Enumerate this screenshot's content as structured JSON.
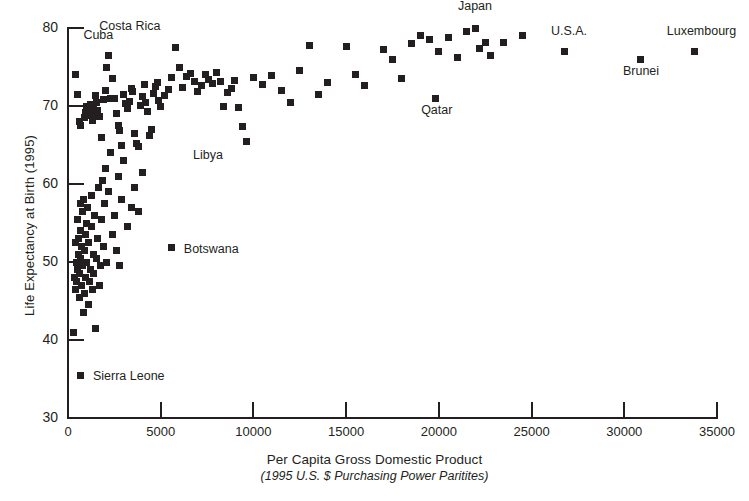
{
  "chart_data": {
    "type": "scatter",
    "title": "",
    "xlabel": "Per Capita Gross Domestic Product",
    "xlabel_sub": "(1995 U.S. $ Purchasing Power Paritites)",
    "ylabel": "Life Expectancy at Birth (1995)",
    "xlim": [
      0,
      35000
    ],
    "ylim": [
      30,
      80
    ],
    "xticks": [
      0,
      5000,
      10000,
      15000,
      20000,
      25000,
      30000,
      35000
    ],
    "xtick_labels": [
      "0",
      "5000",
      "10000",
      "15000",
      "20000",
      "25000",
      "30000",
      "35000"
    ],
    "yticks": [
      30,
      40,
      50,
      60,
      70,
      80
    ],
    "ytick_labels": [
      "30",
      "40",
      "50",
      "60",
      "70",
      "80"
    ],
    "grid": false,
    "legend": "none",
    "marker": "square",
    "marker_color": "#231f20",
    "points": [
      [
        400,
        74.0
      ],
      [
        500,
        71.5
      ],
      [
        600,
        68.0
      ],
      [
        700,
        67.5
      ],
      [
        900,
        68.5
      ],
      [
        950,
        69.2
      ],
      [
        1000,
        70.0
      ],
      [
        1050,
        69.5
      ],
      [
        1100,
        69.0
      ],
      [
        1150,
        68.8
      ],
      [
        1200,
        70.2
      ],
      [
        1250,
        69.6
      ],
      [
        1300,
        68.2
      ],
      [
        1350,
        69.8
      ],
      [
        1400,
        69.1
      ],
      [
        1500,
        71.3
      ],
      [
        1550,
        70.5
      ],
      [
        1600,
        69.4
      ],
      [
        1700,
        68.6
      ],
      [
        1800,
        66.0
      ],
      [
        1900,
        70.8
      ],
      [
        2000,
        72.0
      ],
      [
        2100,
        75.0
      ],
      [
        2200,
        76.5
      ],
      [
        2300,
        70.9
      ],
      [
        2400,
        73.5
      ],
      [
        2500,
        71.0
      ],
      [
        2600,
        69.0
      ],
      [
        2700,
        67.5
      ],
      [
        2800,
        66.8
      ],
      [
        2900,
        65.0
      ],
      [
        3000,
        71.5
      ],
      [
        3100,
        70.3
      ],
      [
        3200,
        69.7
      ],
      [
        3300,
        70.6
      ],
      [
        3400,
        72.3
      ],
      [
        3500,
        71.8
      ],
      [
        3600,
        66.5
      ],
      [
        3700,
        65.2
      ],
      [
        3800,
        64.8
      ],
      [
        3900,
        70.1
      ],
      [
        4000,
        71.2
      ],
      [
        4100,
        72.8
      ],
      [
        4200,
        70.4
      ],
      [
        4300,
        69.3
      ],
      [
        4400,
        66.2
      ],
      [
        4500,
        67.0
      ],
      [
        4600,
        71.6
      ],
      [
        4700,
        72.5
      ],
      [
        4800,
        73.0
      ],
      [
        4900,
        70.7
      ],
      [
        5000,
        69.9
      ],
      [
        5200,
        71.4
      ],
      [
        5400,
        72.1
      ],
      [
        5600,
        73.6
      ],
      [
        5800,
        77.5
      ],
      [
        6000,
        75.0
      ],
      [
        6200,
        72.4
      ],
      [
        6400,
        73.8
      ],
      [
        6600,
        74.2
      ],
      [
        6800,
        73.2
      ],
      [
        7000,
        71.9
      ],
      [
        7200,
        72.6
      ],
      [
        7400,
        74.0
      ],
      [
        7600,
        73.4
      ],
      [
        7800,
        72.9
      ],
      [
        8000,
        74.3
      ],
      [
        8200,
        73.1
      ],
      [
        8400,
        70.0
      ],
      [
        8600,
        71.7
      ],
      [
        8800,
        72.2
      ],
      [
        9000,
        73.3
      ],
      [
        9200,
        69.8
      ],
      [
        9400,
        67.4
      ],
      [
        9600,
        65.5
      ],
      [
        10000,
        73.7
      ],
      [
        10500,
        72.7
      ],
      [
        11000,
        73.9
      ],
      [
        11500,
        72.0
      ],
      [
        12000,
        70.5
      ],
      [
        12500,
        74.5
      ],
      [
        13000,
        77.8
      ],
      [
        13500,
        71.5
      ],
      [
        14000,
        73.0
      ],
      [
        15000,
        77.6
      ],
      [
        15500,
        74.0
      ],
      [
        16000,
        72.6
      ],
      [
        17000,
        77.3
      ],
      [
        17500,
        76.0
      ],
      [
        18000,
        73.5
      ],
      [
        18500,
        78.0
      ],
      [
        19000,
        79.0
      ],
      [
        19500,
        78.5
      ],
      [
        19800,
        71.0
      ],
      [
        20000,
        77.0
      ],
      [
        20500,
        78.8
      ],
      [
        21000,
        76.2
      ],
      [
        21500,
        79.5
      ],
      [
        22000,
        80.0
      ],
      [
        22200,
        77.4
      ],
      [
        22500,
        78.2
      ],
      [
        22800,
        76.5
      ],
      [
        23500,
        78.2
      ],
      [
        24500,
        79.0
      ],
      [
        26800,
        77.0
      ],
      [
        30900,
        76.0
      ],
      [
        33800,
        77.0
      ]
    ],
    "annotations": [
      {
        "label": "Cuba",
        "x": 1800,
        "y": 76.5
      },
      {
        "label": "Costa Rica",
        "x": 3200,
        "y": 77.5
      },
      {
        "label": "Japan",
        "x": 22000,
        "y": 80.0
      },
      {
        "label": "U.S.A.",
        "x": 26800,
        "y": 77.0
      },
      {
        "label": "Luxembourg",
        "x": 33800,
        "y": 77.0
      },
      {
        "label": "Brunei",
        "x": 30900,
        "y": 76.0
      },
      {
        "label": "Qatar",
        "x": 19800,
        "y": 71.0
      },
      {
        "label": "Libya",
        "x": 6200,
        "y": 65.0
      },
      {
        "label": "Botswana",
        "x": 5600,
        "y": 51.8
      },
      {
        "label": "Sierra Leone",
        "x": 700,
        "y": 35.5
      }
    ]
  },
  "axes": {
    "y_title": "Life Expectancy at Birth (1995)",
    "x_title_line1": "Per Capita Gross Domestic Product",
    "x_title_line2": "(1995 U.S. $ Purchasing Power Paritites)",
    "ytick_labels": [
      "80",
      "70",
      "60",
      "50",
      "40",
      "30"
    ],
    "xtick_labels": [
      "0",
      "5000",
      "10000",
      "15000",
      "20000",
      "25000",
      "30000",
      "35000"
    ]
  },
  "annotation_labels": {
    "cuba": "Cuba",
    "costa_rica": "Costa Rica",
    "japan": "Japan",
    "usa": "U.S.A.",
    "luxembourg": "Luxembourg",
    "brunei": "Brunei",
    "qatar": "Qatar",
    "libya": "Libya",
    "botswana": "Botswana",
    "sierra_leone": "Sierra Leone"
  },
  "colors": {
    "ink": "#231f20",
    "background": "#ffffff"
  }
}
